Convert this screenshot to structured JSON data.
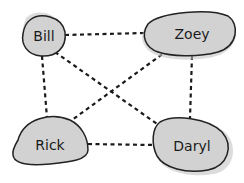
{
  "diagram": {
    "type": "graph",
    "style": "hand-drawn",
    "node_fill": "#d2d2d2",
    "edge_style": "dashed",
    "nodes": [
      {
        "id": "bill",
        "label": "Bill"
      },
      {
        "id": "zoey",
        "label": "Zoey"
      },
      {
        "id": "rick",
        "label": "Rick"
      },
      {
        "id": "daryl",
        "label": "Daryl"
      }
    ],
    "edges": [
      {
        "from": "Bill",
        "to": "Zoey"
      },
      {
        "from": "Bill",
        "to": "Rick"
      },
      {
        "from": "Bill",
        "to": "Daryl"
      },
      {
        "from": "Zoey",
        "to": "Rick"
      },
      {
        "from": "Zoey",
        "to": "Daryl"
      },
      {
        "from": "Rick",
        "to": "Daryl"
      }
    ]
  }
}
